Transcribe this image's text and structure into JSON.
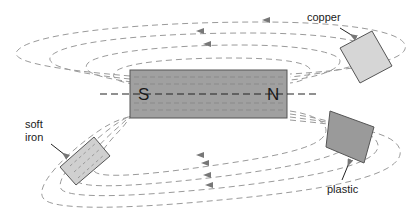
{
  "diagram": {
    "magnet": {
      "south_label": "S",
      "north_label": "N",
      "fill": "#a0a0a0"
    },
    "materials": [
      {
        "id": "copper",
        "label": "copper",
        "fill": "#d6d6d6"
      },
      {
        "id": "plastic",
        "label": "plastic",
        "fill": "#9a9a9a"
      },
      {
        "id": "soft-iron",
        "label_line1": "soft",
        "label_line2": "iron",
        "fill": "#d0d0d0"
      }
    ],
    "colors": {
      "field_line": "#9a9a9a",
      "outline": "#555555",
      "axis": "#222222"
    }
  }
}
